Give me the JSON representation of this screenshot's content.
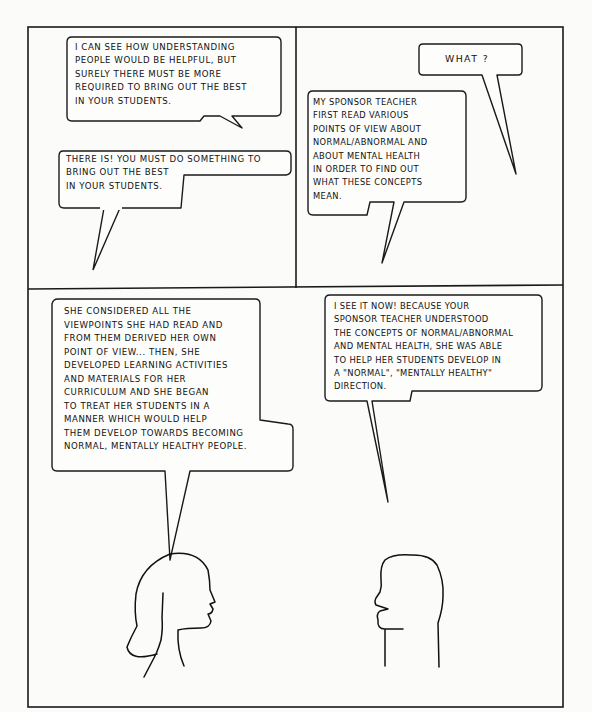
{
  "comic": {
    "panels": [
      {
        "id": "top-left",
        "bubbles": [
          {
            "speaker": "right",
            "text": "I can see how understanding\npeople would be helpful, but\nsurely there must be more\nrequired to bring out the best\nin your students."
          },
          {
            "speaker": "left",
            "text": "There is! You must do something to\nbring out the best\nin your students."
          }
        ]
      },
      {
        "id": "top-right",
        "bubbles": [
          {
            "speaker": "right",
            "text": "What ?"
          },
          {
            "speaker": "left",
            "text": "My sponsor teacher\nfirst read various\npoints of view about\nnormal/abnormal and\nabout mental health\nin order to find out\nwhat these concepts\nmean."
          }
        ]
      },
      {
        "id": "bottom",
        "bubbles": [
          {
            "speaker": "woman",
            "text": "She considered all the\nviewpoints she had read and\nfrom them derived her own\npoint of view... Then, she\ndeveloped learning activities\nand materials for her\ncurriculum and she began\nto treat her students in a\nmanner which would help\nthem develop towards becoming\nnormal, mentally healthy people."
          },
          {
            "speaker": "man",
            "text": "I see it now! Because your\nsponsor teacher understood\nthe concepts of normal/abnormal\nand mental health, she was able\nto help her students develop in\na \"normal\", \"mentally healthy\"\ndirection."
          }
        ],
        "figures": [
          {
            "name": "woman-profile",
            "facing": "right"
          },
          {
            "name": "man-profile",
            "facing": "left"
          }
        ]
      }
    ],
    "colors": {
      "ink": "#1a1a1a",
      "paper": "#fbfbfa"
    }
  }
}
